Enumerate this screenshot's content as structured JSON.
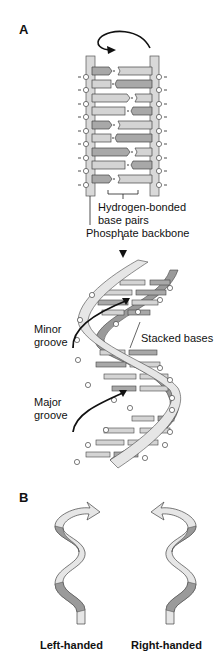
{
  "panels": {
    "a": {
      "label": "A",
      "labels": {
        "hbond_line1": "Hydrogen-bonded",
        "hbond_line2": "base pairs",
        "backbone": "Phosphate backbone",
        "minor_line1": "Minor",
        "minor_line2": "groove",
        "major_line1": "Major",
        "major_line2": "groove",
        "stacked": "Stacked bases"
      }
    },
    "b": {
      "label": "B",
      "left_caption": "Left-handed",
      "right_caption": "Right-handed"
    }
  },
  "colors": {
    "backbone": "#d9d9d9",
    "base_dark": "#a8a8a8",
    "base_light": "#d4d4d4",
    "outline": "#333333",
    "ribbon_light": "#e6e6e6",
    "ribbon_dark": "#9a9a9a"
  }
}
